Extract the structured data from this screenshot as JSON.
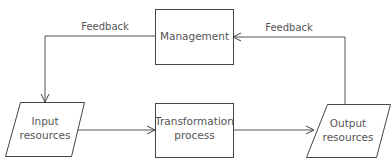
{
  "nodes": {
    "management": {
      "label": "Management"
    },
    "input": {
      "line1": "Input",
      "line2": "resources"
    },
    "transformation": {
      "line1": "Transformation",
      "line2": "process"
    },
    "output": {
      "line1": "Output",
      "line2": "resources"
    }
  },
  "edges": {
    "feedback_left": {
      "label": "Feedback"
    },
    "feedback_right": {
      "label": "Feedback"
    }
  },
  "colors": {
    "stroke": "#444444",
    "text": "#555555",
    "background": "#ffffff"
  }
}
